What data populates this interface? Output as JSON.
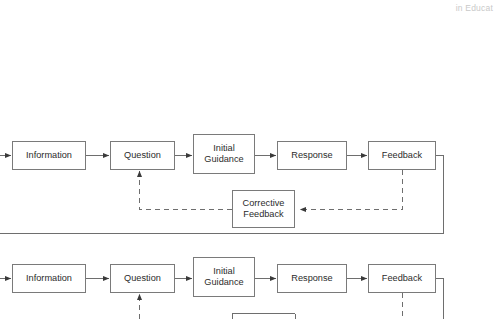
{
  "page": {
    "running_head": "in Educat",
    "background_color": "#ffffff",
    "line_color": "#7a7a7a",
    "text_color": "#2b2b2b"
  },
  "diagram": {
    "type": "flowchart",
    "rows": [
      {
        "id": "row-1",
        "nodes": [
          {
            "id": "information-1",
            "label": "Information",
            "x": 12,
            "y": 141,
            "w": 74,
            "h": 29
          },
          {
            "id": "question-1",
            "label": "Question",
            "x": 110,
            "y": 141,
            "w": 65,
            "h": 29
          },
          {
            "id": "initial-guidance-1",
            "label": "Initial\nGuidance",
            "x": 193,
            "y": 134,
            "w": 62,
            "h": 40
          },
          {
            "id": "response-1",
            "label": "Response",
            "x": 277,
            "y": 141,
            "w": 70,
            "h": 29
          },
          {
            "id": "feedback-1",
            "label": "Feedback",
            "x": 368,
            "y": 141,
            "w": 68,
            "h": 29
          },
          {
            "id": "corrective-feedback-1",
            "label": "Corrective\nFeedback",
            "x": 232,
            "y": 190,
            "w": 63,
            "h": 38
          }
        ]
      },
      {
        "id": "row-2",
        "nodes": [
          {
            "id": "information-2",
            "label": "Information",
            "x": 12,
            "y": 264,
            "w": 74,
            "h": 29
          },
          {
            "id": "question-2",
            "label": "Question",
            "x": 110,
            "y": 264,
            "w": 65,
            "h": 29
          },
          {
            "id": "initial-guidance-2",
            "label": "Initial\nGuidance",
            "x": 193,
            "y": 257,
            "w": 62,
            "h": 40
          },
          {
            "id": "response-2",
            "label": "Response",
            "x": 277,
            "y": 264,
            "w": 70,
            "h": 29
          },
          {
            "id": "feedback-2",
            "label": "Feedback",
            "x": 368,
            "y": 264,
            "w": 68,
            "h": 29
          },
          {
            "id": "corrective-feedback-2",
            "label": "Corrective\nFeedback",
            "x": 232,
            "y": 313,
            "w": 63,
            "h": 38
          }
        ]
      }
    ],
    "edges": [
      {
        "id": "edge-enter-information-1",
        "style": "solid",
        "arrow": true,
        "from": "page-left",
        "to": "information-1"
      },
      {
        "id": "edge-information-question-1",
        "style": "solid",
        "arrow": true,
        "from": "information-1",
        "to": "question-1"
      },
      {
        "id": "edge-question-guidance-1",
        "style": "solid",
        "arrow": true,
        "from": "question-1",
        "to": "initial-guidance-1"
      },
      {
        "id": "edge-guidance-response-1",
        "style": "solid",
        "arrow": true,
        "from": "initial-guidance-1",
        "to": "response-1"
      },
      {
        "id": "edge-response-feedback-1",
        "style": "solid",
        "arrow": true,
        "from": "response-1",
        "to": "feedback-1"
      },
      {
        "id": "edge-feedback-corrective-1",
        "style": "dashed",
        "arrow": true,
        "from": "feedback-1",
        "to": "corrective-feedback-1"
      },
      {
        "id": "edge-corrective-question-1",
        "style": "dashed",
        "arrow": true,
        "from": "corrective-feedback-1",
        "to": "question-1"
      },
      {
        "id": "edge-feedback-loopback-1",
        "style": "solid",
        "arrow": false,
        "from": "feedback-1",
        "to": "page-left"
      },
      {
        "id": "edge-enter-information-2",
        "style": "solid",
        "arrow": true,
        "from": "page-left",
        "to": "information-2"
      },
      {
        "id": "edge-information-question-2",
        "style": "solid",
        "arrow": true,
        "from": "information-2",
        "to": "question-2"
      },
      {
        "id": "edge-question-guidance-2",
        "style": "solid",
        "arrow": true,
        "from": "question-2",
        "to": "initial-guidance-2"
      },
      {
        "id": "edge-guidance-response-2",
        "style": "solid",
        "arrow": true,
        "from": "initial-guidance-2",
        "to": "response-2"
      },
      {
        "id": "edge-response-feedback-2",
        "style": "solid",
        "arrow": true,
        "from": "response-2",
        "to": "feedback-2"
      },
      {
        "id": "edge-feedback-corrective-2",
        "style": "dashed",
        "arrow": true,
        "from": "feedback-2",
        "to": "corrective-feedback-2"
      },
      {
        "id": "edge-corrective-question-2",
        "style": "dashed",
        "arrow": true,
        "from": "corrective-feedback-2",
        "to": "question-2"
      },
      {
        "id": "edge-feedback-loopback-2",
        "style": "solid",
        "arrow": false,
        "from": "feedback-2",
        "to": "page-left"
      }
    ]
  }
}
